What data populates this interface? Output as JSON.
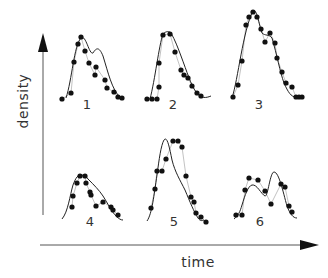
{
  "figure": {
    "y_axis_label": "density",
    "x_axis_label": "time",
    "colors": {
      "ink": "#111111",
      "fit_line": "#222222",
      "data_line": "#999999",
      "background": "#ffffff"
    }
  },
  "chart_data": {
    "type": "line",
    "title": "",
    "xlabel": "time",
    "ylabel": "density",
    "grid": false,
    "legend": null,
    "note": "Six small-multiple panels; each shows observed data (dots connected by thin line) and a smooth fitted curve. Coordinates are pixel positions (x right, y down) since axes have no numeric ticks.",
    "panels": [
      {
        "label": "1",
        "label_pos": [
          87,
          104
        ],
        "points": [
          [
            62,
            99
          ],
          [
            71,
            93
          ],
          [
            74,
            62
          ],
          [
            78,
            44
          ],
          [
            81,
            37
          ],
          [
            85,
            51
          ],
          [
            89,
            63
          ],
          [
            95,
            75
          ],
          [
            96,
            67
          ],
          [
            105,
            80
          ],
          [
            107,
            88
          ],
          [
            114,
            92
          ],
          [
            118,
            97
          ],
          [
            122,
            98
          ]
        ],
        "fit": "M66,98 C72,80 74,45 81,38 C86,34 89,55 93,53 C96,48 99,46 103,56 C108,72 112,90 120,97"
      },
      {
        "label": "2",
        "label_pos": [
          173,
          104
        ],
        "points": [
          [
            147,
            99
          ],
          [
            152,
            99
          ],
          [
            157,
            99
          ],
          [
            159,
            87
          ],
          [
            159,
            63
          ],
          [
            163,
            35
          ],
          [
            170,
            34
          ],
          [
            175,
            52
          ],
          [
            181,
            70
          ],
          [
            184,
            75
          ],
          [
            188,
            78
          ],
          [
            192,
            86
          ],
          [
            197,
            93
          ],
          [
            201,
            96
          ]
        ],
        "fit": "M150,99 C155,80 159,45 163,34 C166,31 169,31 171,33 C175,40 178,48 181,56 C187,72 191,85 196,92 C201,99 206,98 211,96"
      },
      {
        "label": "3",
        "label_pos": [
          259,
          104
        ],
        "points": [
          [
            233,
            97
          ],
          [
            238,
            85
          ],
          [
            242,
            61
          ],
          [
            246,
            25
          ],
          [
            249,
            17
          ],
          [
            253,
            12
          ],
          [
            257,
            17
          ],
          [
            261,
            29
          ],
          [
            265,
            42
          ],
          [
            270,
            33
          ],
          [
            275,
            43
          ],
          [
            277,
            58
          ],
          [
            282,
            72
          ],
          [
            286,
            83
          ],
          [
            292,
            87
          ],
          [
            296,
            97
          ],
          [
            299,
            97
          ],
          [
            302,
            97
          ]
        ],
        "fit": "M232,98 C238,80 243,30 253,11 C257,8 259,25 262,33 C265,36 269,34 272,38 C277,55 280,72 284,83 C288,92 291,97 296,97 L303,97"
      },
      {
        "label": "4",
        "label_pos": [
          90,
          221
        ],
        "points": [
          [
            72,
            207
          ],
          [
            73,
            196
          ],
          [
            77,
            183
          ],
          [
            80,
            176
          ],
          [
            85,
            176
          ],
          [
            86,
            183
          ],
          [
            90,
            192
          ],
          [
            91,
            195
          ],
          [
            96,
            206
          ],
          [
            103,
            202
          ],
          [
            111,
            207
          ],
          [
            113,
            210
          ],
          [
            118,
            215
          ]
        ],
        "fit": "M62,219 C68,212 70,195 73,185 C76,177 78,175 81,175 C84,175 86,176 88,179 C94,185 99,190 103,196 C108,204 112,212 116,216 C119,219 121,220 123,220"
      },
      {
        "label": "5",
        "label_pos": [
          174,
          221
        ],
        "points": [
          [
            151,
            208
          ],
          [
            155,
            189
          ],
          [
            157,
            171
          ],
          [
            162,
            171
          ],
          [
            166,
            159
          ],
          [
            173,
            141
          ],
          [
            178,
            141
          ],
          [
            182,
            147
          ],
          [
            186,
            176
          ],
          [
            191,
            197
          ],
          [
            194,
            202
          ],
          [
            196,
            213
          ],
          [
            201,
            217
          ],
          [
            206,
            222
          ]
        ],
        "fit": "M147,221 C152,214 154,195 157,175 C159,160 161,145 164,140 C167,136 169,145 172,160 C175,172 180,180 185,190 C190,202 194,212 198,218 C200,221 202,221 204,220"
      },
      {
        "label": "6",
        "label_pos": [
          260,
          221
        ],
        "points": [
          [
            236,
            215
          ],
          [
            242,
            215
          ],
          [
            245,
            190
          ],
          [
            249,
            178
          ],
          [
            258,
            180
          ],
          [
            265,
            191
          ],
          [
            271,
            204
          ],
          [
            281,
            184
          ],
          [
            285,
            187
          ],
          [
            289,
            206
          ],
          [
            292,
            212
          ]
        ],
        "fit": "M234,219 C238,216 240,212 242,205 C245,195 248,186 252,185 C257,184 261,194 265,196 C268,197 270,172 274,172 C279,172 283,192 287,206 C290,214 293,218 297,218"
      }
    ]
  }
}
